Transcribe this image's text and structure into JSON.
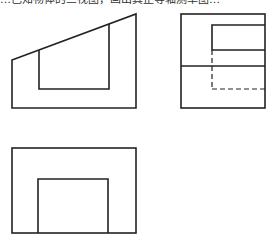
{
  "caption": {
    "text": "…已知物体的三视图，画出其正等轴测草图…"
  },
  "diagram": {
    "type": "orthographic-three-view",
    "stroke_color": "#222222",
    "views": [
      {
        "name": "front-view",
        "outline": [
          [
            12,
            60
          ],
          [
            136,
            14
          ],
          [
            136,
            108
          ],
          [
            12,
            108
          ]
        ],
        "inner_notch": [
          [
            39,
            50
          ],
          [
            39,
            89
          ],
          [
            109,
            89
          ],
          [
            109,
            24
          ]
        ]
      },
      {
        "name": "side-view",
        "outer_rect": {
          "x1": 181,
          "y1": 14,
          "x2": 265,
          "y2": 108
        },
        "inner_rect": {
          "x1": 212,
          "y1": 25,
          "x2": 265,
          "y2": 50
        },
        "divider_y": 66,
        "hidden_lines": [
          [
            [
              212,
              50
            ],
            [
              212,
              89
            ]
          ],
          [
            [
              212,
              89
            ],
            [
              265,
              89
            ]
          ]
        ]
      },
      {
        "name": "top-view",
        "outer_rect": {
          "x1": 12,
          "y1": 148,
          "x2": 136,
          "y2": 233
        },
        "inner_rect": {
          "x1": 38,
          "y1": 179,
          "x2": 108,
          "y2": 233
        }
      }
    ]
  }
}
